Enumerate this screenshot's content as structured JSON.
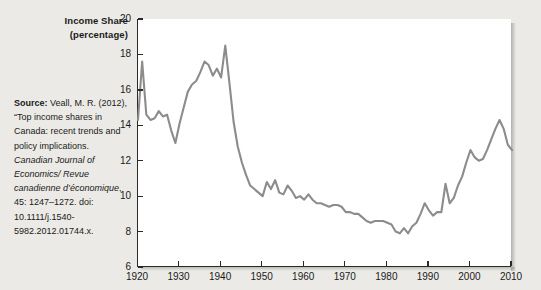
{
  "figure": {
    "axis_title_line1": "Income Share",
    "axis_title_line2": "(percentage)",
    "line_color": "#8e8c8a",
    "plot_background": "#ffffff",
    "page_background": "#eceae6"
  },
  "source": {
    "lead_label": "Source:",
    "text_after_lead": " Veall, M. R. (2012), “Top income shares in Canada: recent trends and policy implications. ",
    "journal_italic": "Canadian Journal of Economics/ Revue canadienne d’économique",
    "tail": ", 45: 1247–1272. doi: 10.1111/j.1540-5982.2012.01744.x."
  },
  "chart_data": {
    "type": "line",
    "title": "",
    "xlabel": "",
    "ylabel": "Income Share (percentage)",
    "xlim": [
      1920,
      2010
    ],
    "ylim": [
      6,
      20
    ],
    "xticks": [
      1920,
      1930,
      1940,
      1950,
      1960,
      1970,
      1980,
      1990,
      2000,
      2010
    ],
    "yticks": [
      6,
      8,
      10,
      12,
      14,
      16,
      18,
      20
    ],
    "grid": false,
    "legend": false,
    "series": [
      {
        "name": "Top income share, Canada",
        "x": [
          1920,
          1921,
          1922,
          1923,
          1924,
          1925,
          1926,
          1927,
          1928,
          1929,
          1930,
          1931,
          1932,
          1933,
          1934,
          1935,
          1936,
          1937,
          1938,
          1939,
          1940,
          1941,
          1942,
          1943,
          1944,
          1945,
          1946,
          1947,
          1948,
          1949,
          1950,
          1951,
          1952,
          1953,
          1954,
          1955,
          1956,
          1957,
          1958,
          1959,
          1960,
          1961,
          1962,
          1963,
          1964,
          1965,
          1966,
          1967,
          1968,
          1969,
          1970,
          1971,
          1972,
          1973,
          1974,
          1975,
          1976,
          1977,
          1978,
          1979,
          1980,
          1981,
          1982,
          1983,
          1984,
          1985,
          1986,
          1987,
          1988,
          1989,
          1990,
          1991,
          1992,
          1993,
          1994,
          1995,
          1996,
          1997,
          1998,
          1999,
          2000,
          2001,
          2002,
          2003,
          2004,
          2005,
          2006,
          2007,
          2008,
          2009,
          2010
        ],
        "values": [
          14.3,
          17.6,
          14.6,
          14.3,
          14.4,
          14.8,
          14.5,
          14.6,
          13.7,
          13.0,
          14.1,
          15.0,
          15.9,
          16.3,
          16.5,
          17.0,
          17.6,
          17.4,
          16.8,
          17.2,
          16.7,
          18.5,
          16.4,
          14.2,
          12.8,
          11.9,
          11.2,
          10.6,
          10.4,
          10.2,
          10.0,
          10.8,
          10.4,
          10.9,
          10.2,
          10.1,
          10.6,
          10.3,
          9.9,
          10.0,
          9.8,
          10.1,
          9.8,
          9.6,
          9.6,
          9.5,
          9.4,
          9.5,
          9.5,
          9.4,
          9.1,
          9.1,
          9.0,
          9.0,
          8.8,
          8.6,
          8.5,
          8.6,
          8.6,
          8.6,
          8.5,
          8.4,
          8.0,
          7.9,
          8.2,
          7.9,
          8.3,
          8.5,
          9.0,
          9.6,
          9.2,
          8.9,
          9.1,
          9.1,
          10.7,
          9.6,
          9.9,
          10.6,
          11.1,
          11.9,
          12.6,
          12.2,
          12.0,
          12.1,
          12.6,
          13.2,
          13.8,
          14.3,
          13.8,
          12.9,
          12.6
        ]
      }
    ]
  }
}
